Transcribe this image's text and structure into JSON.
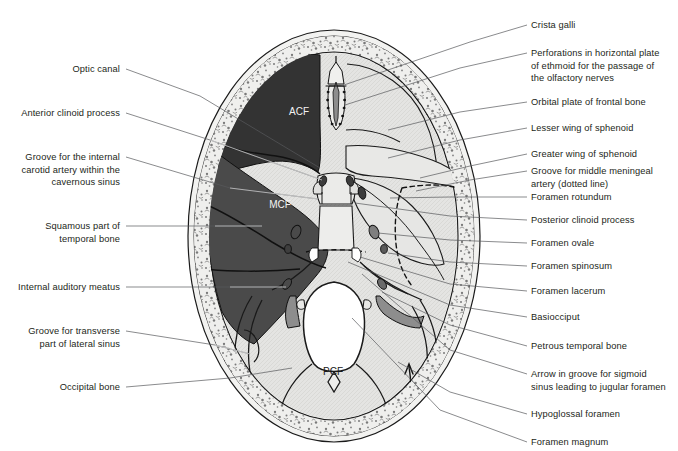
{
  "figure": {
    "inner_labels": [
      {
        "id": "acf",
        "text": "ACF",
        "x": 299,
        "y": 115
      },
      {
        "id": "mcf",
        "text": "MCF",
        "x": 280,
        "y": 208
      },
      {
        "id": "pcf",
        "text": "PCF",
        "x": 333,
        "y": 375
      }
    ],
    "colors": {
      "acf_fill": "#333333",
      "mcf_fill": "#4a4a4a",
      "bone_fill": "#e3e3e1",
      "diploe_fill": "#ededeb",
      "foramen_fill": "#ffffff",
      "groove_fill": "#8d8d8d",
      "outline": "#1a1a1a",
      "leader": "#58595b",
      "leader_on_dark": "#d9d9d9",
      "text": "#231f20"
    }
  },
  "labels_left": [
    {
      "id": "optic-canal",
      "text": "Optic canal",
      "x": 120,
      "y": 63,
      "line": [
        [
          126,
          69
        ],
        [
          200,
          96
        ],
        [
          320,
          168
        ]
      ]
    },
    {
      "id": "anterior-clinoid-process",
      "text": "Anterior clinoid process",
      "x": 120,
      "y": 107,
      "line": [
        [
          126,
          113
        ],
        [
          210,
          140
        ],
        [
          322,
          180
        ]
      ]
    },
    {
      "id": "groove-internal-carotid-artery",
      "text": "Groove for the internal\ncarotid artery within the\ncavernous sinus",
      "x": 120,
      "y": 151,
      "line": [
        [
          126,
          157
        ],
        [
          230,
          188
        ],
        [
          318,
          199
        ]
      ]
    },
    {
      "id": "squamous-part-temporal-bone",
      "text": "Squamous part of\ntemporal bone",
      "x": 120,
      "y": 220,
      "line": [
        [
          126,
          226
        ],
        [
          215,
          226
        ],
        [
          262,
          226
        ]
      ]
    },
    {
      "id": "internal-auditory-meatus",
      "text": "Internal auditory meatus",
      "x": 120,
      "y": 281,
      "line": [
        [
          126,
          287
        ],
        [
          230,
          287
        ],
        [
          286,
          287
        ]
      ]
    },
    {
      "id": "groove-transverse-lateral-sinus",
      "text": "Groove for transverse\npart of lateral sinus",
      "x": 120,
      "y": 325,
      "line": [
        [
          126,
          331
        ],
        [
          215,
          345
        ],
        [
          250,
          354
        ]
      ]
    },
    {
      "id": "occipital-bone",
      "text": "Occipital bone",
      "x": 120,
      "y": 381,
      "line": [
        [
          126,
          387
        ],
        [
          230,
          378
        ],
        [
          292,
          368
        ]
      ]
    }
  ],
  "labels_right": [
    {
      "id": "crista-galli",
      "text": "Crista galli",
      "x": 531,
      "y": 19,
      "line": [
        [
          527,
          25
        ],
        [
          470,
          42
        ],
        [
          341,
          86
        ]
      ]
    },
    {
      "id": "perforations-ethmoid",
      "text": "Perforations in horizontal plate\nof ethmoid for the passage of\nthe olfactory nerves",
      "x": 531,
      "y": 47,
      "line": [
        [
          527,
          53
        ],
        [
          460,
          68
        ],
        [
          345,
          105
        ]
      ]
    },
    {
      "id": "orbital-plate-frontal-bone",
      "text": "Orbital plate of frontal bone",
      "x": 531,
      "y": 96,
      "line": [
        [
          527,
          102
        ],
        [
          460,
          112
        ],
        [
          388,
          130
        ]
      ]
    },
    {
      "id": "lesser-wing-sphenoid",
      "text": "Lesser wing of sphenoid",
      "x": 531,
      "y": 122,
      "line": [
        [
          527,
          128
        ],
        [
          460,
          140
        ],
        [
          388,
          158
        ]
      ]
    },
    {
      "id": "greater-wing-sphenoid",
      "text": "Greater wing of sphenoid",
      "x": 531,
      "y": 148,
      "line": [
        [
          527,
          154
        ],
        [
          470,
          166
        ],
        [
          420,
          178
        ]
      ]
    },
    {
      "id": "groove-middle-meningeal-artery",
      "text": "Groove for middle meningeal\nartery (dotted line)",
      "x": 531,
      "y": 165,
      "line": [
        [
          527,
          171
        ],
        [
          470,
          180
        ],
        [
          416,
          191
        ]
      ]
    },
    {
      "id": "foramen-rotundum",
      "text": "Foramen rotundum",
      "x": 531,
      "y": 191,
      "line": [
        [
          527,
          197
        ],
        [
          450,
          197
        ],
        [
          390,
          198
        ]
      ]
    },
    {
      "id": "posterior-clinoid-process",
      "text": "Posterior clinoid process",
      "x": 531,
      "y": 214,
      "line": [
        [
          527,
          220
        ],
        [
          450,
          216
        ],
        [
          355,
          203
        ]
      ]
    },
    {
      "id": "foramen-ovale",
      "text": "Foramen ovale",
      "x": 531,
      "y": 237,
      "line": [
        [
          527,
          243
        ],
        [
          450,
          240
        ],
        [
          378,
          233
        ]
      ]
    },
    {
      "id": "foramen-spinosum",
      "text": "Foramen spinosum",
      "x": 531,
      "y": 260,
      "line": [
        [
          527,
          266
        ],
        [
          450,
          262
        ],
        [
          388,
          253
        ]
      ]
    },
    {
      "id": "foramen-lacerum",
      "text": "Foramen lacerum",
      "x": 531,
      "y": 285,
      "line": [
        [
          527,
          291
        ],
        [
          450,
          284
        ],
        [
          360,
          257
        ]
      ]
    },
    {
      "id": "basiocciput",
      "text": "Basiocciput",
      "x": 531,
      "y": 311,
      "line": [
        [
          527,
          317
        ],
        [
          450,
          305
        ],
        [
          348,
          262
        ]
      ]
    },
    {
      "id": "petrous-temporal-bone",
      "text": "Petrous temporal bone",
      "x": 531,
      "y": 340,
      "line": [
        [
          527,
          346
        ],
        [
          450,
          325
        ],
        [
          382,
          292
        ]
      ]
    },
    {
      "id": "arrow-sigmoid-sinus-jugular-foramen",
      "text": "Arrow in groove for sigmoid\nsinus leading to jugular foramen",
      "x": 531,
      "y": 368,
      "line": [
        [
          527,
          374
        ],
        [
          450,
          350
        ],
        [
          362,
          274
        ]
      ]
    },
    {
      "id": "hypoglossal-foramen",
      "text": "Hypoglossal foramen",
      "x": 531,
      "y": 408,
      "line": [
        [
          527,
          414
        ],
        [
          450,
          392
        ],
        [
          398,
          362
        ]
      ]
    },
    {
      "id": "foramen-magnum",
      "text": "Foramen magnum",
      "x": 531,
      "y": 436,
      "line": [
        [
          527,
          442
        ],
        [
          440,
          410
        ],
        [
          352,
          318
        ]
      ]
    }
  ]
}
